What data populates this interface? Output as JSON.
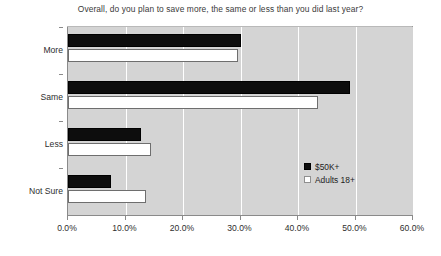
{
  "chart_data": {
    "type": "bar",
    "orientation": "horizontal",
    "title": "Overall, do you plan to save more, the same or less than you did last year?",
    "xlabel": "",
    "ylabel": "",
    "categories": [
      "More",
      "Same",
      "Less",
      "Not Sure"
    ],
    "series": [
      {
        "name": "$50K+",
        "values": [
          30.0,
          49.0,
          12.7,
          7.5
        ],
        "color": "#000000"
      },
      {
        "name": "Adults 18+",
        "values": [
          29.5,
          43.5,
          14.5,
          13.6
        ],
        "color": "#ffffff"
      }
    ],
    "xlim": [
      0.0,
      60.0
    ],
    "xticks": [
      0.0,
      10.0,
      20.0,
      30.0,
      40.0,
      50.0,
      60.0
    ],
    "xtick_labels": [
      "0.0%",
      "10.0%",
      "20.0%",
      "30.0%",
      "40.0%",
      "50.0%",
      "60.0%"
    ],
    "grid": true,
    "grid_axis": "x",
    "legend_position": "inside-right",
    "plot_background": "#d4d4d4",
    "figure_background": "#ffffff"
  },
  "legend": {
    "items": [
      {
        "label": "$50K+",
        "swatch": "black-square"
      },
      {
        "label": "Adults 18+",
        "swatch": "white-square"
      }
    ]
  }
}
